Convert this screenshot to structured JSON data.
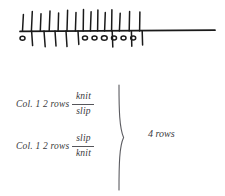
{
  "diagram": {
    "name": "knitting-stitch-row-diagram",
    "baseline": {
      "x1": 20,
      "x2": 215,
      "y": 31
    },
    "up_ticks_x": [
      22,
      31,
      40,
      49,
      58,
      67,
      75,
      83,
      90,
      97,
      104,
      111,
      119,
      129,
      139
    ],
    "down_ticks_x": [
      31,
      44,
      55,
      66,
      78,
      112,
      131,
      142
    ],
    "ovals_below_x": [
      22,
      80,
      90,
      101,
      112,
      123,
      133
    ],
    "oval_rx": 2.6,
    "oval_ry": 2.0,
    "stroke_color": "#1a1a1a",
    "stroke_width": 1.4
  },
  "formulas": {
    "row_1": {
      "lead": "Col. 1 2 rows",
      "numerator": "knit",
      "denominator": "slip"
    },
    "row_2": {
      "lead": "Col. 1 2 rows",
      "numerator": "slip",
      "denominator": "knit"
    },
    "brace_label": "4 rows",
    "text_color": "#39393c",
    "rule_color": "#55555a"
  }
}
